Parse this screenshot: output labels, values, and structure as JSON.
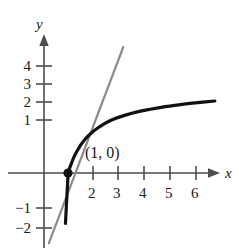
{
  "chart_data": {
    "type": "line",
    "title": "",
    "xlabel": "x",
    "ylabel": "y",
    "xlim": [
      -1.5,
      7.2
    ],
    "ylim": [
      -2.9,
      5.0
    ],
    "grid": false,
    "legend": "none",
    "x_ticks": [
      2,
      3,
      4,
      5,
      6
    ],
    "x_tick_labels": [
      "2",
      "3",
      "4",
      "5",
      "6"
    ],
    "y_ticks": [
      4,
      3,
      2,
      1,
      -1,
      -2
    ],
    "y_tick_labels": [
      "4",
      "3",
      "2",
      "1",
      "−1",
      "−2"
    ],
    "annotations": [
      {
        "name": "tangent-point",
        "label": "(1, 0)",
        "x": 1,
        "y": 0,
        "marker": "filled-circle"
      }
    ],
    "series": [
      {
        "name": "logarithmic-curve",
        "style": "solid",
        "color": "#111111",
        "width": 3.2,
        "x": [
          0.88,
          0.95,
          1.0,
          1.1,
          1.25,
          1.5,
          1.8,
          2.2,
          2.7,
          3.3,
          4.0,
          4.8,
          5.6,
          6.4,
          7.0
        ],
        "y": [
          -2.8,
          -1.0,
          0.0,
          0.45,
          0.95,
          1.55,
          2.05,
          2.5,
          2.9,
          3.2,
          3.45,
          3.65,
          3.8,
          3.92,
          4.0
        ]
      },
      {
        "name": "tangent-line",
        "style": "solid",
        "color": "#8c8c8c",
        "width": 2.2,
        "x": [
          0.2,
          1.0,
          3.25
        ],
        "y": [
          -3.9,
          0.0,
          7.0
        ]
      }
    ]
  },
  "labels": {
    "y_axis": "y",
    "x_axis": "x",
    "point": "(1, 0)",
    "y4": "4",
    "y3": "3",
    "y2": "2",
    "y1": "1",
    "ym1": "−1",
    "ym2": "−2",
    "x2": "2",
    "x3": "3",
    "x4": "4",
    "x5": "5",
    "x6": "6"
  },
  "colors": {
    "curve": "#111111",
    "tangent": "#8c8c8c",
    "axis": "#4d4d4d",
    "text": "#1a1a1a",
    "background": "#ffffff"
  }
}
